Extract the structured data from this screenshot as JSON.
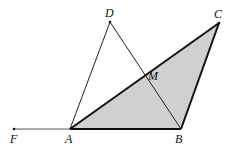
{
  "diagram": {
    "type": "geometry",
    "points": {
      "F": {
        "label": "F",
        "x": 14,
        "y": 129
      },
      "A": {
        "label": "A",
        "x": 70,
        "y": 129
      },
      "B": {
        "label": "B",
        "x": 181,
        "y": 129
      },
      "C": {
        "label": "C",
        "x": 219,
        "y": 23
      },
      "D": {
        "label": "D",
        "x": 110,
        "y": 22
      },
      "M": {
        "label": "M",
        "x": 147,
        "y": 76
      }
    },
    "shaded_triangle": [
      "A",
      "B",
      "C"
    ],
    "thin_segments": [
      [
        "F",
        "A"
      ],
      [
        "A",
        "D"
      ],
      [
        "D",
        "B"
      ]
    ],
    "thick_segments": [
      [
        "A",
        "B"
      ],
      [
        "B",
        "C"
      ],
      [
        "C",
        "A"
      ]
    ],
    "colors": {
      "fill": "#d0d0d0",
      "stroke": "#111111"
    }
  }
}
